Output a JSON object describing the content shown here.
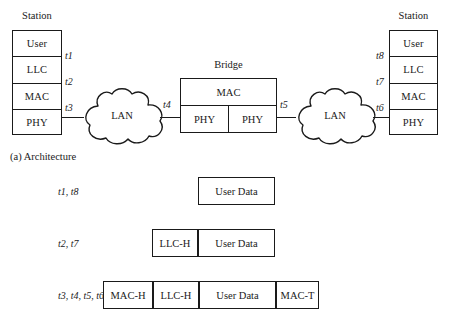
{
  "figure": {
    "section_caption": "(a) Architecture"
  },
  "left_station": {
    "title": "Station",
    "layers": [
      {
        "label": "User"
      },
      {
        "label": "LLC"
      },
      {
        "label": "MAC"
      },
      {
        "label": "PHY"
      }
    ],
    "points": [
      "t1",
      "t2",
      "t3"
    ]
  },
  "right_station": {
    "title": "Station",
    "layers": [
      {
        "label": "User"
      },
      {
        "label": "LLC"
      },
      {
        "label": "MAC"
      },
      {
        "label": "PHY"
      }
    ],
    "points": [
      "t8",
      "t7",
      "t6"
    ]
  },
  "bridge": {
    "title": "Bridge",
    "mac_label": "MAC",
    "phy_left_label": "PHY",
    "phy_right_label": "PHY",
    "point_left": "t4",
    "point_right": "t5"
  },
  "lans": [
    {
      "label": "LAN"
    },
    {
      "label": "LAN"
    }
  ],
  "pdus": [
    {
      "points": "t1, t8",
      "fields": [
        {
          "label": "User Data",
          "width": 77
        }
      ]
    },
    {
      "points": "t2, t7",
      "fields": [
        {
          "label": "LLC-H",
          "width": 46
        },
        {
          "label": "User Data",
          "width": 77
        }
      ]
    },
    {
      "points": "t3, t4, t5, t6",
      "fields": [
        {
          "label": "MAC-H",
          "width": 50
        },
        {
          "label": "LLC-H",
          "width": 46
        },
        {
          "label": "User Data",
          "width": 77
        },
        {
          "label": "MAC-T",
          "width": 43
        }
      ]
    }
  ],
  "colors": {
    "ink": "#1a1a1a",
    "paper": "#ffffff"
  }
}
